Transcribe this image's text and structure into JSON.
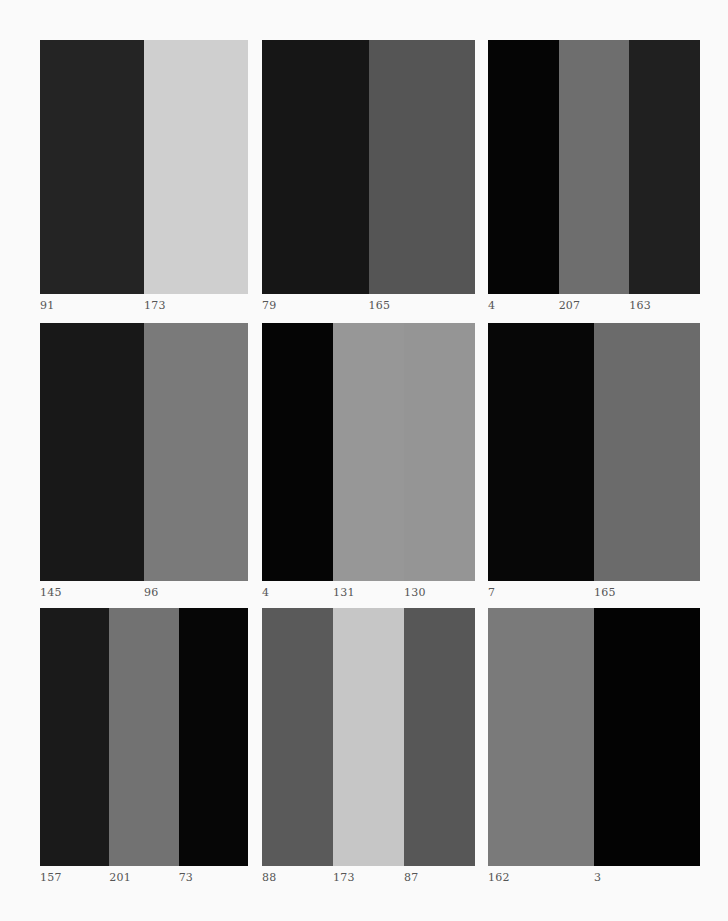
{
  "page": {
    "background": "#fafafa",
    "label_color": "#555555"
  },
  "panels": [
    {
      "row": 0,
      "col": 0,
      "stripes": [
        {
          "label": "91",
          "color": "#242424"
        },
        {
          "label": "173",
          "color": "#cfcfcf"
        }
      ]
    },
    {
      "row": 0,
      "col": 1,
      "stripes": [
        {
          "label": "79",
          "color": "#161616"
        },
        {
          "label": "165",
          "color": "#555555"
        }
      ]
    },
    {
      "row": 0,
      "col": 2,
      "stripes": [
        {
          "label": "4",
          "color": "#050505"
        },
        {
          "label": "207",
          "color": "#6e6e6e"
        },
        {
          "label": "163",
          "color": "#202020"
        }
      ]
    },
    {
      "row": 1,
      "col": 0,
      "stripes": [
        {
          "label": "145",
          "color": "#181818"
        },
        {
          "label": "96",
          "color": "#7a7a7a"
        }
      ]
    },
    {
      "row": 1,
      "col": 1,
      "stripes": [
        {
          "label": "4",
          "color": "#050505"
        },
        {
          "label": "131",
          "color": "#979797"
        },
        {
          "label": "130",
          "color": "#959595"
        }
      ]
    },
    {
      "row": 1,
      "col": 2,
      "stripes": [
        {
          "label": "7",
          "color": "#070707"
        },
        {
          "label": "165",
          "color": "#6b6b6b"
        }
      ]
    },
    {
      "row": 2,
      "col": 0,
      "stripes": [
        {
          "label": "157",
          "color": "#1a1a1a"
        },
        {
          "label": "201",
          "color": "#727272"
        },
        {
          "label": "73",
          "color": "#060606"
        }
      ]
    },
    {
      "row": 2,
      "col": 1,
      "stripes": [
        {
          "label": "88",
          "color": "#5a5a5a"
        },
        {
          "label": "173",
          "color": "#c6c6c6"
        },
        {
          "label": "87",
          "color": "#575757"
        }
      ]
    },
    {
      "row": 2,
      "col": 2,
      "stripes": [
        {
          "label": "162",
          "color": "#7a7a7a"
        },
        {
          "label": "3",
          "color": "#030303"
        }
      ]
    }
  ]
}
